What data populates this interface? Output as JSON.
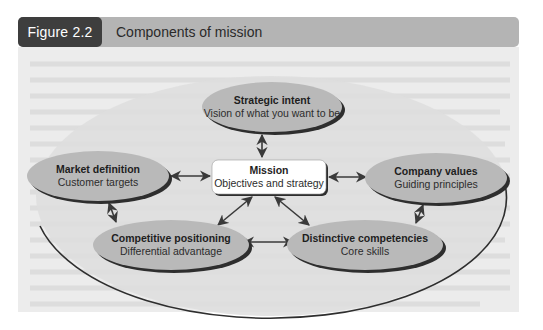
{
  "figure": {
    "number_label": "Figure 2.2",
    "title": "Components of mission"
  },
  "diagram": {
    "center": {
      "title": "Mission",
      "subtitle": "Objectives and strategy"
    },
    "nodes": [
      {
        "id": "strategic-intent",
        "title": "Strategic intent",
        "subtitle": "Vision of what you want to be"
      },
      {
        "id": "market-definition",
        "title": "Market definition",
        "subtitle": "Customer targets"
      },
      {
        "id": "company-values",
        "title": "Company values",
        "subtitle": "Guiding principles"
      },
      {
        "id": "competitive-positioning",
        "title": "Competitive positioning",
        "subtitle": "Differential advantage"
      },
      {
        "id": "distinctive-competencies",
        "title": "Distinctive competencies",
        "subtitle": "Core skills"
      }
    ],
    "connections": [
      {
        "from": "Mission",
        "to": "Strategic intent",
        "type": "bidirectional"
      },
      {
        "from": "Mission",
        "to": "Market definition",
        "type": "bidirectional"
      },
      {
        "from": "Mission",
        "to": "Company values",
        "type": "bidirectional"
      },
      {
        "from": "Mission",
        "to": "Competitive positioning",
        "type": "bidirectional"
      },
      {
        "from": "Mission",
        "to": "Distinctive competencies",
        "type": "bidirectional"
      },
      {
        "from": "Market definition",
        "to": "Competitive positioning",
        "type": "bidirectional"
      },
      {
        "from": "Company values",
        "to": "Distinctive competencies",
        "type": "bidirectional"
      },
      {
        "from": "Competitive positioning",
        "to": "Distinctive competencies",
        "type": "bidirectional"
      }
    ]
  },
  "colors": {
    "badge": "#3e3e3e",
    "title_bar": "#b4b4b4",
    "figure_background": "#ececec",
    "outer_ellipse": "#dcdcdc",
    "node_fill": "#b9b9b9",
    "node_shadow": "#2e2e2e",
    "mission_box": "#ffffff",
    "arrow": "#3a3a3a"
  }
}
